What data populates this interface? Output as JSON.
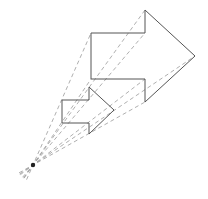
{
  "diagram": {
    "type": "dilation",
    "width": 208,
    "height": 199,
    "center": {
      "x": 33,
      "y": 165
    },
    "stroke_color": "#555555",
    "dash_color": "#9a9a9a",
    "point_color": "#222222",
    "small_arrow": [
      [
        62,
        100
      ],
      [
        89,
        100
      ],
      [
        89,
        87
      ],
      [
        114,
        110
      ],
      [
        89,
        134
      ],
      [
        89,
        123
      ],
      [
        62,
        123
      ]
    ],
    "large_arrow": [
      [
        91,
        33
      ],
      [
        145,
        33
      ],
      [
        145,
        10
      ],
      [
        195,
        56
      ],
      [
        145,
        102
      ],
      [
        145,
        79
      ],
      [
        91,
        79
      ]
    ]
  }
}
